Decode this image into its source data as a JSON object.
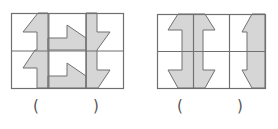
{
  "colors": {
    "grid_line": "#707070",
    "shape_fill": "#d6d6d6",
    "shape_stroke": "#707070",
    "background": "#ffffff"
  },
  "figures": [
    {
      "id": "figure-1",
      "grid": {
        "rows": 2,
        "cols": 3,
        "x": 11,
        "y": 13,
        "width": 112,
        "height": 75
      },
      "shapes": [
        {
          "name": "left-stepped-arrow-strip",
          "points": "38,13 48,13 48,88 37,88 37,68 23,68 35,50 37,50 37,32 23,32"
        },
        {
          "name": "top-flag-arrow",
          "points": "48,38 67,38 67,25 86,38 86,50 48,50"
        },
        {
          "name": "bottom-flag-arrow",
          "points": "48,76 67,76 67,63 86,76 86,88 48,88"
        },
        {
          "name": "right-stepped-arrow-strip",
          "points": "86,13 97,13 97,32 110,32 97,50 97,70 110,70 98,88 86,88"
        }
      ],
      "answer_blank": {
        "open": "(",
        "close": ")",
        "value": ""
      }
    },
    {
      "id": "figure-2",
      "grid": {
        "rows": 2,
        "cols": 3,
        "x": 157,
        "y": 14,
        "width": 108,
        "height": 74
      },
      "shapes": [
        {
          "name": "double-headed-vertical-arrow",
          "points": "178,14 205,14 215,30 203,30 203,70 215,70 205,88 178,88 168,70 182,70 182,30 168,30"
        },
        {
          "name": "right-half-bracket-arrow",
          "points": "252,14 265,14 265,88 252,88 242,70 247,70 247,32 242,32"
        }
      ],
      "answer_blank": {
        "open": "(",
        "close": ")",
        "value": ""
      }
    }
  ]
}
